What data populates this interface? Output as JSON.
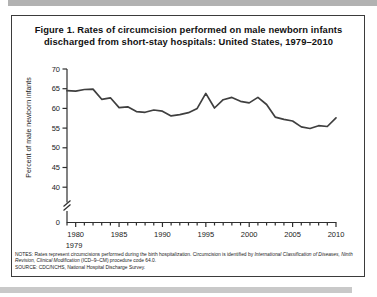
{
  "page": {
    "title_line1": "Figure 1. Rates of circumcision performed on male newborn infants",
    "title_line2": "discharged from short-stay hospitals: United States, 1979–2010"
  },
  "notes": {
    "prefix": "NOTES: Rates represent circumcisions performed during the birth hospitalization. Circumcision is identified by ",
    "italic": "International Classification of Diseases, Ninth Revision, Clinical Modification",
    "suffix": " (ICD–9–CM) procedure code 64.0.",
    "source": "SOURCE: CDC/NCHS, National Hospital Discharge Survey."
  },
  "chart_data": {
    "type": "line",
    "title": "Figure 1. Rates of circumcision performed on male newborn infants discharged from short-stay hospitals: United States, 1979–2010",
    "xlabel": "",
    "ylabel": "Percent of male newborn infants",
    "x": [
      1979,
      1980,
      1981,
      1982,
      1983,
      1984,
      1985,
      1986,
      1987,
      1988,
      1989,
      1990,
      1991,
      1992,
      1993,
      1994,
      1995,
      1996,
      1997,
      1998,
      1999,
      2000,
      2001,
      2002,
      2003,
      2004,
      2005,
      2006,
      2007,
      2008,
      2009,
      2010
    ],
    "values": [
      64.5,
      64.4,
      64.8,
      64.9,
      62.3,
      62.7,
      60.2,
      60.4,
      59.2,
      59.0,
      59.6,
      59.3,
      58.1,
      58.4,
      58.9,
      60.0,
      63.8,
      60.1,
      62.2,
      62.8,
      61.8,
      61.4,
      62.8,
      61.0,
      57.8,
      57.2,
      56.8,
      55.3,
      54.9,
      55.6,
      55.4,
      57.6
    ],
    "y_tick_values": [
      70,
      65,
      60,
      55,
      50,
      45,
      40
    ],
    "y_zero_label": "0",
    "x_tick_labels": [
      1980,
      1985,
      1990,
      1995,
      2000,
      2005,
      2010
    ],
    "x_start_label": "1979",
    "ylim_display": [
      40,
      70
    ],
    "axis_break": true,
    "grid": false,
    "legend": "none",
    "line_color": "#3f3f3f"
  },
  "colors": {
    "background": "#ffffff",
    "border": "#3b3b3b",
    "scan_strip": "#b2b2b2",
    "text": "#111111"
  }
}
